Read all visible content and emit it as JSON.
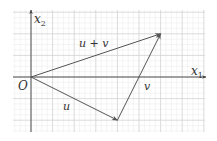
{
  "diagram": {
    "type": "vector-addition",
    "axes": {
      "x_label": "x",
      "x_sub": "1",
      "y_label": "x",
      "y_sub": "2",
      "origin_label": "O"
    },
    "grid": {
      "major_spacing_units": 1,
      "minor_subdivisions": 4,
      "x_range": [
        -0.8,
        8.0
      ],
      "y_range": [
        -2.5,
        3.1
      ]
    },
    "vectors": [
      {
        "name": "u",
        "label": "u",
        "from": [
          0,
          0
        ],
        "to": [
          4,
          -2
        ]
      },
      {
        "name": "v",
        "label": "v",
        "from": [
          4,
          -2
        ],
        "to": [
          6,
          2
        ]
      },
      {
        "name": "u+v",
        "label": "u + v",
        "from": [
          0,
          0
        ],
        "to": [
          6,
          2
        ]
      }
    ],
    "colors": {
      "vector": "#555555",
      "axis": "#444444",
      "grid_major": "#d4d4d4",
      "grid_minor": "#ececec"
    }
  }
}
